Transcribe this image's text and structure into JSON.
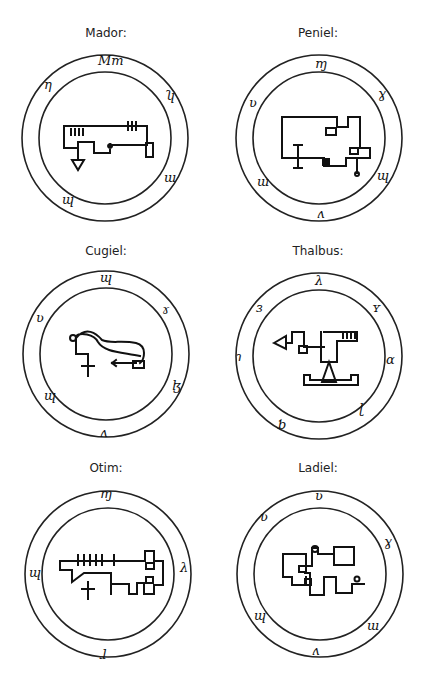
{
  "seals": [
    {
      "name": "Mador:",
      "glyphs": [
        "Mm",
        "η",
        "ʮ",
        "ɯ",
        "ɰ"
      ]
    },
    {
      "name": "Peniel:",
      "glyphs": [
        "ɱ",
        "ɣ",
        "ʋ",
        "ɰ",
        "ʌ",
        "ɯ"
      ]
    },
    {
      "name": "Cugiel:",
      "glyphs": [
        "ɰ",
        "ʋ",
        "ɤ",
        "ɮ",
        "ɰ",
        "ʌ"
      ]
    },
    {
      "name": "Thalbus:",
      "glyphs": [
        "λ",
        "ɜ",
        "ʏ",
        "ɿ",
        "ɑ",
        "ɭ",
        "ƅ"
      ]
    },
    {
      "name": "Otim:",
      "glyphs": [
        "ɱ",
        "ɰ",
        "λ",
        "ɺ"
      ]
    },
    {
      "name": "Ladiel:",
      "glyphs": [
        "ʋ",
        "ʋ",
        "ɣ",
        "ɰ",
        "ɯ",
        "ʌ"
      ]
    }
  ]
}
